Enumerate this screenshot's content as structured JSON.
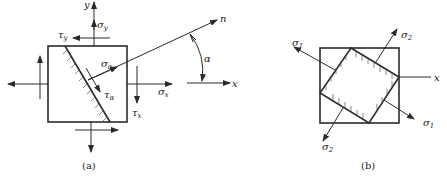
{
  "figure_a": {
    "caption": "(a)",
    "labels": {
      "y_axis": "y",
      "x_axis": "x",
      "normal": "n",
      "angle": "α",
      "sigma_y": "σ",
      "sigma_y_sub": "y",
      "tau_y": "τ",
      "tau_y_sub": "y",
      "sigma_x": "σ",
      "sigma_x_sub": "x",
      "tau_x": "τ",
      "tau_x_sub": "x",
      "sigma_alpha": "σ",
      "sigma_alpha_sub": "α",
      "tau_alpha": "τ",
      "tau_alpha_sub": "α"
    }
  },
  "figure_b": {
    "caption": "(b)",
    "labels": {
      "x_axis": "x",
      "sigma1_top": "σ",
      "sigma1_top_sub": "1",
      "sigma1_bottom": "σ",
      "sigma1_bottom_sub": "1",
      "sigma2_top": "σ",
      "sigma2_top_sub": "2",
      "sigma2_bottom": "σ",
      "sigma2_bottom_sub": "2"
    }
  },
  "colors": {
    "stroke": "#2a2a2a",
    "background": "#ffffff"
  }
}
